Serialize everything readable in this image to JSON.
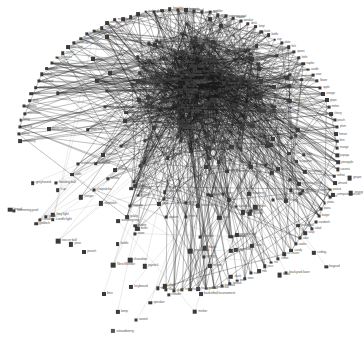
{
  "figure": {
    "kind": "force-directed-network-graph",
    "title": "",
    "background_color": "#ffffff",
    "node_color": "#3a3a3a",
    "edge_color": "#1a1a1a",
    "label_color": "#5d5d5d",
    "node_shape": "square",
    "width": 363,
    "height": 347
  },
  "chart_data": {
    "type": "scatter",
    "title": "",
    "xlabel": "",
    "ylabel": "",
    "grid": false,
    "legend": null,
    "xlim": [
      0,
      363
    ],
    "ylim": [
      0,
      347
    ],
    "node_count": 372,
    "edge_count": 1480,
    "layout": {
      "center": [
        178,
        150
      ],
      "radius_x": 160,
      "radius_y": 140,
      "dense_core": [
        205,
        95
      ],
      "rim_band": 9
    },
    "visible_labels": [
      "strawberry",
      "galaxy",
      "capacity",
      "string",
      "mushroom",
      "banana",
      "duck",
      "pear",
      "greyhound",
      "keyboard",
      "ceiling",
      "sword",
      "bowling ball",
      "chopsticks",
      "noodle",
      "table cloth",
      "candle light",
      "New Monitor",
      "backyard lawn",
      "basketball tournament",
      "volleyball",
      "computer mouse",
      "mousepad",
      "keypad",
      "chocolate",
      "joystick",
      "trackpad",
      "gridlock",
      "water pistol",
      "fairy light",
      "wedding ring",
      "baguette",
      "bread",
      "soccer ball",
      "sprinkler",
      "spring",
      "swimming pool",
      "monitor",
      "speaker",
      "desk",
      "lamp",
      "book",
      "bottle",
      "cup",
      "plate",
      "fork",
      "spoon",
      "knife",
      "napkin",
      "candle",
      "vase",
      "flower",
      "apple",
      "orange",
      "grape",
      "melon",
      "cherry",
      "peach",
      "plum",
      "lemon",
      "lime",
      "mango",
      "papaya",
      "pineapple",
      "coconut",
      "walnut",
      "almond",
      "peanut",
      "rice",
      "pasta",
      "pizza",
      "burger",
      "sandwich",
      "salad",
      "soup",
      "cake",
      "cookie",
      "candy",
      "ice cream",
      "coffee",
      "tea",
      "juice",
      "milk",
      "water",
      "wine",
      "beer",
      "football",
      "baseball",
      "tennis ball",
      "golf ball",
      "hockey stick",
      "racket",
      "helmet",
      "glove",
      "skate",
      "ski",
      "surfboard",
      "bicycle",
      "treadmill",
      "dumbbell",
      "yoga mat",
      "stopwatch",
      "whistle",
      "scoreboard",
      "stadium",
      "referee",
      "tournament",
      "trophy",
      "medal",
      "ribbon",
      "team",
      "coach",
      "printer",
      "scanner",
      "router",
      "cable",
      "charger",
      "battery",
      "laptop",
      "tablet",
      "phone",
      "headphone",
      "microphone",
      "webcam",
      "projector",
      "screen",
      "mouse pad",
      "usb drive",
      "hard disk",
      "memory card",
      "graphics card",
      "processor",
      "cooling fan",
      "power supply",
      "motherboard",
      "bedroom",
      "kitchen",
      "bathroom",
      "garden",
      "garage",
      "balcony",
      "window",
      "door",
      "curtain",
      "carpet",
      "sofa",
      "chair",
      "table",
      "shelf",
      "mirror",
      "clock",
      "picture frame",
      "pillow",
      "blanket",
      "mattress"
    ]
  },
  "annotations": {
    "isolated_node_label": "strawberry"
  }
}
